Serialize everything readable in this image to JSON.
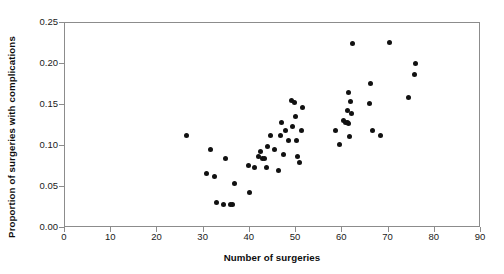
{
  "chart_data": {
    "type": "scatter",
    "title": "",
    "xlabel": "Number of surgeries",
    "ylabel": "Proportion of surgeries with complications",
    "xlim": [
      0,
      90
    ],
    "ylim": [
      0,
      0.25
    ],
    "xticks": [
      0,
      10,
      20,
      30,
      40,
      50,
      60,
      70,
      80,
      90
    ],
    "yticks": [
      0.0,
      0.05,
      0.1,
      0.15,
      0.2,
      0.25
    ],
    "xtick_labels": [
      "0",
      "10",
      "20",
      "30",
      "40",
      "50",
      "60",
      "70",
      "80",
      "90"
    ],
    "ytick_labels": [
      "0.00",
      "0.05",
      "0.10",
      "0.15",
      "0.20",
      "0.25"
    ],
    "grid": false,
    "legend": false,
    "marker": {
      "shape": "circle",
      "color": "#111111",
      "size_px": 5
    },
    "frame_color": "#8c8c8c",
    "background_color": "#ffffff",
    "n_points": 56,
    "points": [
      {
        "x": 26.5,
        "y": 0.111
      },
      {
        "x": 30.8,
        "y": 0.065
      },
      {
        "x": 31.8,
        "y": 0.094
      },
      {
        "x": 32.6,
        "y": 0.061
      },
      {
        "x": 33.0,
        "y": 0.03
      },
      {
        "x": 34.6,
        "y": 0.028
      },
      {
        "x": 35.0,
        "y": 0.083
      },
      {
        "x": 36.5,
        "y": 0.027
      },
      {
        "x": 36.8,
        "y": 0.053
      },
      {
        "x": 39.9,
        "y": 0.075
      },
      {
        "x": 40.2,
        "y": 0.042
      },
      {
        "x": 41.2,
        "y": 0.072
      },
      {
        "x": 42.0,
        "y": 0.086
      },
      {
        "x": 43.0,
        "y": 0.084
      },
      {
        "x": 43.4,
        "y": 0.083
      },
      {
        "x": 43.8,
        "y": 0.072
      },
      {
        "x": 44.1,
        "y": 0.098
      },
      {
        "x": 44.6,
        "y": 0.112
      },
      {
        "x": 45.6,
        "y": 0.094
      },
      {
        "x": 46.4,
        "y": 0.069
      },
      {
        "x": 47.0,
        "y": 0.128
      },
      {
        "x": 47.4,
        "y": 0.089
      },
      {
        "x": 48.0,
        "y": 0.118
      },
      {
        "x": 48.5,
        "y": 0.106
      },
      {
        "x": 49.2,
        "y": 0.154
      },
      {
        "x": 49.8,
        "y": 0.152
      },
      {
        "x": 50.0,
        "y": 0.135
      },
      {
        "x": 50.2,
        "y": 0.106
      },
      {
        "x": 50.6,
        "y": 0.086
      },
      {
        "x": 51.0,
        "y": 0.079
      },
      {
        "x": 51.3,
        "y": 0.118
      },
      {
        "x": 58.7,
        "y": 0.118
      },
      {
        "x": 59.6,
        "y": 0.101
      },
      {
        "x": 60.4,
        "y": 0.13
      },
      {
        "x": 60.8,
        "y": 0.128
      },
      {
        "x": 61.3,
        "y": 0.127
      },
      {
        "x": 61.6,
        "y": 0.126
      },
      {
        "x": 61.4,
        "y": 0.142
      },
      {
        "x": 61.5,
        "y": 0.164
      },
      {
        "x": 61.8,
        "y": 0.11
      },
      {
        "x": 62.5,
        "y": 0.224
      },
      {
        "x": 66.2,
        "y": 0.151
      },
      {
        "x": 66.4,
        "y": 0.175
      },
      {
        "x": 66.8,
        "y": 0.118
      },
      {
        "x": 68.4,
        "y": 0.112
      },
      {
        "x": 70.4,
        "y": 0.225
      },
      {
        "x": 74.6,
        "y": 0.158
      },
      {
        "x": 75.8,
        "y": 0.186
      },
      {
        "x": 76.0,
        "y": 0.199
      },
      {
        "x": 36.1,
        "y": 0.028
      },
      {
        "x": 42.6,
        "y": 0.092
      },
      {
        "x": 46.8,
        "y": 0.112
      },
      {
        "x": 49.5,
        "y": 0.122
      },
      {
        "x": 51.6,
        "y": 0.146
      },
      {
        "x": 61.9,
        "y": 0.153
      },
      {
        "x": 62.1,
        "y": 0.138
      }
    ]
  }
}
